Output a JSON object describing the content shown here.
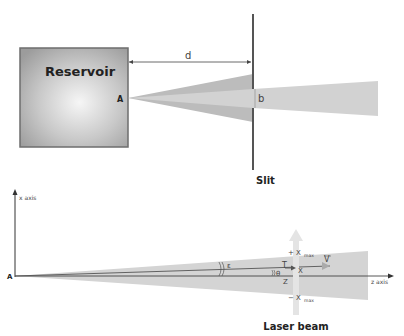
{
  "top_diagram": {
    "reservoir_label": "Reservoir",
    "point_label": "A",
    "distance_label": "d",
    "slit_width_label": "b",
    "slit_label": "Slit"
  },
  "bottom_diagram": {
    "point_label": "A",
    "x_axis_label": "x axis",
    "z_axis_label": "z axis",
    "angle_epsilon_label": "ε",
    "angle_theta_label": "θ",
    "velocity_label": "V",
    "t_label": "T",
    "x_label": "X",
    "z_label": "Z",
    "x_max_plus": "+ X",
    "x_max_minus": "− X",
    "x_max_sub": "max",
    "laser_label": "Laser beam"
  },
  "colors": {
    "reservoir_edge": "#7a7a7a",
    "reservoir_center": "#f4f4f4",
    "reservoir_outer": "#9a9a9a",
    "cone_outer": "#bdbdbd",
    "cone_inner": "#d0d0d0",
    "beam": "#d4d4d4",
    "slit": "#555555",
    "laser": "#e6e6e6"
  }
}
